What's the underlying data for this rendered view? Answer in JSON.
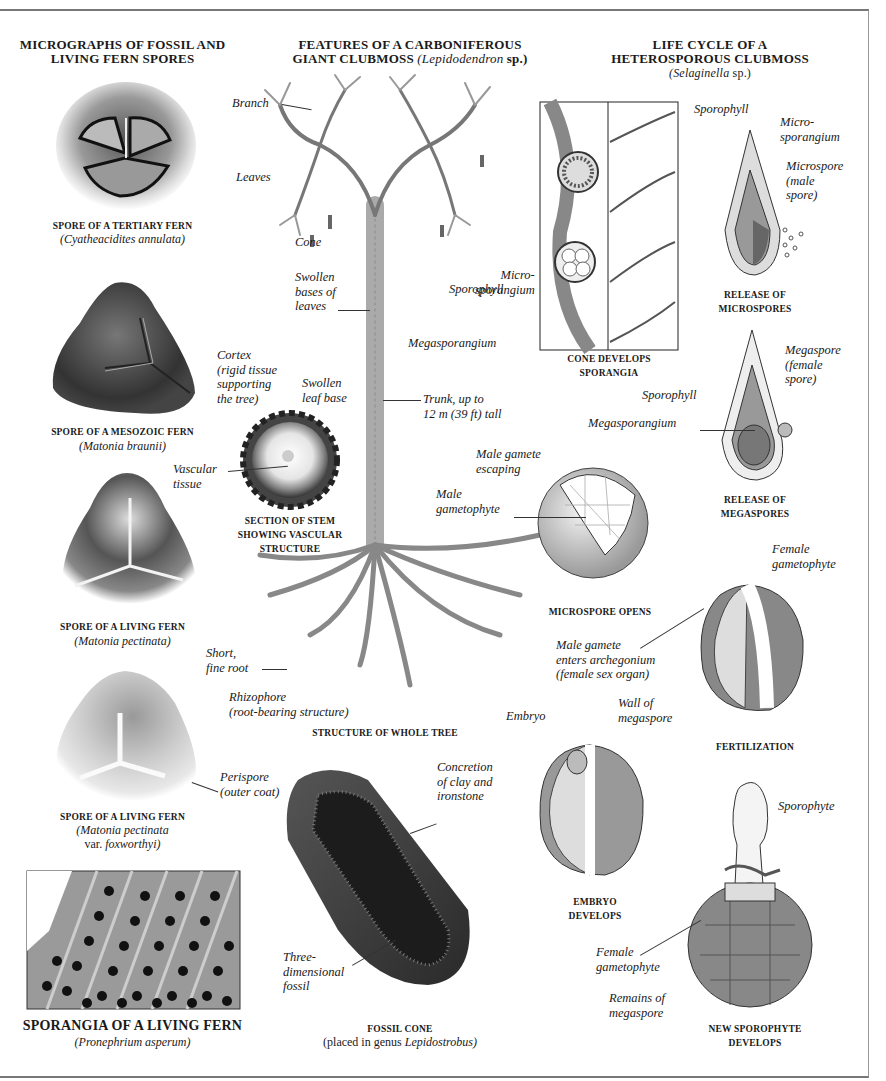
{
  "sections": {
    "spores": {
      "title": "MICROGRAPHS OF FOSSIL AND LIVING FERN SPORES",
      "title_line1": "MICROGRAPHS OF FOSSIL AND",
      "title_line2": "LIVING FERN SPORES",
      "items": [
        {
          "caption": "SPORE OF A TERTIARY FERN",
          "species": "(Cyatheacidites annulata)"
        },
        {
          "caption": "SPORE OF A MESOZOIC FERN",
          "species": "(Matonia braunii)"
        },
        {
          "caption": "SPORE OF A LIVING FERN",
          "species": "(Matonia pectinata)"
        },
        {
          "caption": "SPORE OF A LIVING FERN",
          "species": "(Matonia pectinata",
          "species_line2_prefix": "var. ",
          "species_line2_italic": "foxworthyi)",
          "label": "Perispore\n(outer coat)"
        }
      ],
      "sporangia": {
        "caption": "SPORANGIA OF A LIVING FERN",
        "species": "(Pronephrium asperum)"
      }
    },
    "clubmoss": {
      "title_line1": "FEATURES OF A CARBONIFEROUS",
      "title_line2_prefix": "GIANT CLUBMOSS ",
      "title_line2_italic": "(Lepidodendron",
      "title_line2_suffix": " sp.)",
      "labels": {
        "branch": "Branch",
        "leaves": "Leaves",
        "cone": "Cone",
        "swollen_bases": "Swollen\nbases of\nleaves",
        "trunk": "Trunk, up to\n12 m (39 ft) tall",
        "cortex": "Cortex\n(rigid tissue\nsupporting\nthe tree)",
        "swollen_leaf_base": "Swollen\nleaf base",
        "vascular": "Vascular\ntissue",
        "short_root": "Short,\nfine root",
        "rhizophore": "Rhizophore\n(root-bearing structure)",
        "concretion": "Concretion\nof clay and\nironstone",
        "three_d": "Three-\ndimensional\nfossil"
      },
      "stem_caption": "SECTION OF STEM SHOWING VASCULAR STRUCTURE",
      "stem_caption_lines": [
        "SECTION OF STEM",
        "SHOWING VASCULAR",
        "STRUCTURE"
      ],
      "tree_caption": "STRUCTURE OF WHOLE TREE",
      "fossil_caption": "FOSSIL CONE",
      "fossil_sub_prefix": "(placed in genus ",
      "fossil_sub_italic": "Lepidostrobus)"
    },
    "lifecycle": {
      "title_line1": "LIFE CYCLE OF A",
      "title_line2": "HETEROSPOROUS CLUBMOSS",
      "title_line3_italic": "(Selaginella",
      "title_line3_suffix": " sp.)",
      "labels": {
        "micro_sporangium_cone": "Micro-\nsporangium",
        "sporophyll_cone": "Sporophyll",
        "megasporangium_cone": "Megasporangium",
        "sporophyll_micro": "Sporophyll",
        "microsporangium": "Micro-\nsporangium",
        "microspore": "Microspore\n(male\nspore)",
        "megaspore": "Megaspore\n(female\nspore)",
        "sporophyll_mega": "Sporophyll",
        "megasporangium_mega": "Megasporangium",
        "male_gamete_escaping": "Male gamete\nescaping",
        "male_gametophyte": "Male\ngametophyte",
        "female_gametophyte": "Female\ngametophyte",
        "male_gamete_enters": "Male gamete\nenters archegonium\n(female sex organ)",
        "wall_of_megaspore": "Wall of\nmegaspore",
        "embryo": "Embryo",
        "sporophyte": "Sporophyte",
        "female_gametophyte_2": "Female\ngametophyte",
        "remains": "Remains of\nmegaspore"
      },
      "captions": {
        "cone": [
          "CONE DEVELOPS",
          "SPORANGIA"
        ],
        "micro_release": [
          "RELEASE OF",
          "MICROSPORES"
        ],
        "mega_release": [
          "RELEASE OF",
          "MEGASPORES"
        ],
        "microspore_opens": "MICROSPORE OPENS",
        "fertilization": "FERTILIZATION",
        "embryo": [
          "EMBRYO",
          "DEVELOPS"
        ],
        "new_sporophyte": [
          "NEW SPOROPHYTE",
          "DEVELOPS"
        ]
      }
    }
  },
  "colors": {
    "ink": "#1a1a1a",
    "leader": "#333333",
    "frame": "#777777",
    "photo_dark": "#3a3a3a",
    "photo_mid": "#7a7a7a",
    "photo_light": "#cfcfcf"
  }
}
